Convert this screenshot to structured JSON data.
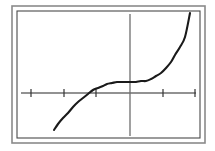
{
  "figure": {
    "background_color": "#ffffff"
  },
  "frame": {
    "outer": {
      "name": "outer border",
      "x": 12,
      "y": 6,
      "width": 193,
      "height": 137,
      "color": "#8a8a8a",
      "stroke_width": 1.6
    },
    "inner": {
      "name": "inner border",
      "x": 17,
      "y": 11,
      "width": 183,
      "height": 127,
      "color": "#4a4a4a",
      "stroke_width": 1.1
    }
  },
  "chart_data": {
    "type": "line",
    "title": "",
    "subtitle": "",
    "xlabel": "",
    "ylabel": "",
    "grid": false,
    "legend": "none",
    "legend_entries": [],
    "annotations": [],
    "axes": {
      "x_axis": {
        "name": "x-axis",
        "pixel_y": 93,
        "pixel_x_start": 21,
        "pixel_x_end": 196,
        "color": "#6e6e6e",
        "stroke_width": 1.3
      },
      "y_axis": {
        "name": "y-axis",
        "pixel_x": 130,
        "pixel_y_start": 14,
        "pixel_y_end": 136,
        "color": "#6e6e6e",
        "stroke_width": 1.3
      },
      "origin": {
        "pixel_x": 130,
        "pixel_y": 93
      },
      "unit_px": 32.5,
      "xlim": [
        -3.35,
        2.03
      ],
      "ylim": [
        -1.32,
        2.43
      ]
    },
    "x_ticks": {
      "name": "x-axis tick marks",
      "color": "#333333",
      "stroke_width": 1.2,
      "half_length_px": 4,
      "pixel_positions": [
        31,
        64,
        96,
        163,
        195
      ],
      "values": [
        -3,
        -2,
        -1,
        1,
        2
      ],
      "labels": [
        "",
        "",
        "",
        "",
        ""
      ]
    },
    "y_ticks": {
      "name": "y-axis tick marks",
      "pixel_positions": [],
      "values": [],
      "labels": []
    },
    "series": [
      {
        "name": "cubic curve",
        "color": "#1a1a1a",
        "stroke_width": 2.1,
        "x": [
          -2.34,
          -2.2,
          -2.05,
          -1.9,
          -1.75,
          -1.6,
          -1.45,
          -1.3,
          -1.15,
          -1.0,
          -0.85,
          -0.7,
          -0.55,
          -0.4,
          -0.25,
          -0.1,
          0.05,
          0.2,
          0.35,
          0.5,
          0.65,
          0.8,
          0.95,
          1.1,
          1.25,
          1.4,
          1.55,
          1.7,
          1.85
        ],
        "y": [
          -1.14,
          -0.95,
          -0.77,
          -0.6,
          -0.43,
          -0.28,
          -0.14,
          -0.02,
          0.08,
          0.16,
          0.23,
          0.27,
          0.3,
          0.32,
          0.33,
          0.33,
          0.33,
          0.34,
          0.35,
          0.38,
          0.43,
          0.51,
          0.62,
          0.76,
          0.94,
          1.16,
          1.42,
          1.73,
          2.09
        ],
        "pixel_points": [
          [
            54,
            130
          ],
          [
            58,
            124
          ],
          [
            63,
            118
          ],
          [
            68,
            113
          ],
          [
            73,
            107
          ],
          [
            78,
            102
          ],
          [
            83,
            98
          ],
          [
            88,
            94
          ],
          [
            93,
            90
          ],
          [
            98,
            88
          ],
          [
            103,
            86
          ],
          [
            107,
            84
          ],
          [
            112,
            83
          ],
          [
            117,
            82
          ],
          [
            122,
            82
          ],
          [
            127,
            82
          ],
          [
            132,
            82
          ],
          [
            136,
            82
          ],
          [
            141,
            81
          ],
          [
            146,
            81
          ],
          [
            151,
            79
          ],
          [
            156,
            76
          ],
          [
            161,
            73
          ],
          [
            166,
            68
          ],
          [
            171,
            62
          ],
          [
            175,
            55
          ],
          [
            180,
            47
          ],
          [
            185,
            37
          ],
          [
            190,
            25
          ]
        ],
        "endpoint_start": {
          "pixel_x": 54,
          "pixel_y": 130
        },
        "endpoint_end": {
          "pixel_x": 190,
          "pixel_y": 13
        },
        "inflection_plateau": {
          "pixel_x_range": [
            110,
            145
          ],
          "pixel_y": 82
        }
      }
    ]
  }
}
